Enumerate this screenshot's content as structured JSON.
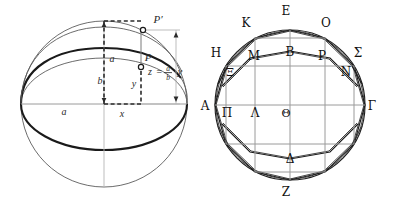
{
  "sheet": {
    "title": "Sphere with inscribed ellipse and Archimedean inscribed polygon",
    "background_color": "#ffffff",
    "ink_color": "#1a1a1a",
    "faint_ink_color": "#5b5b5b",
    "axis_color": "#9a9a9a",
    "width": 396,
    "height": 211
  },
  "figures": [
    {
      "id": "left-figure",
      "name": "sphere-ellipse-projection",
      "caption": "",
      "geometry": {
        "circle_center_x": 104,
        "circle_center_y": 104,
        "circle_radius": 83,
        "ellipse_semi_major": 83,
        "ellipse_semi_minor": 46
      },
      "labels": [
        {
          "key": "p_prime",
          "text": "P′",
          "x": 158,
          "y": 23,
          "style": "math"
        },
        {
          "key": "p",
          "text": "P",
          "x": 148,
          "y": 61,
          "style": "math"
        },
        {
          "key": "a_vert",
          "text": "a",
          "x": 112,
          "y": 62,
          "style": "math"
        },
        {
          "key": "b_vert",
          "text": "b",
          "x": 100,
          "y": 84,
          "style": "math"
        },
        {
          "key": "y_inner",
          "text": "y",
          "x": 134,
          "y": 87,
          "style": "math"
        },
        {
          "key": "a_horiz",
          "text": "a",
          "x": 64,
          "y": 115,
          "style": "math"
        },
        {
          "key": "x_horiz",
          "text": "x",
          "x": 122,
          "y": 117,
          "style": "math"
        }
      ],
      "equation": {
        "key": "z_relation",
        "lhs": "z",
        "equals": "=",
        "numerator": "a",
        "denominator": "b",
        "rhs": "y",
        "plain": "z = (a/b) y",
        "x": 152,
        "y": 72
      },
      "points": [
        {
          "key": "P",
          "x": 141,
          "y": 67
        },
        {
          "key": "P'",
          "x": 143,
          "y": 30
        }
      ]
    },
    {
      "id": "right-figure",
      "name": "circle-inscribed-polygon",
      "caption": "",
      "geometry": {
        "circle_center_x": 92,
        "circle_center_y": 105,
        "circle_radius": 75
      },
      "labels": [
        {
          "key": "E",
          "text": "Ε",
          "x": 88,
          "y": 15,
          "style": "greek"
        },
        {
          "key": "K",
          "text": "Κ",
          "x": 48,
          "y": 27,
          "style": "greek"
        },
        {
          "key": "O",
          "text": "Ο",
          "x": 128,
          "y": 27,
          "style": "greek"
        },
        {
          "key": "H",
          "text": "Η",
          "x": 18,
          "y": 57,
          "style": "greek"
        },
        {
          "key": "M",
          "text": "Μ",
          "x": 56,
          "y": 60,
          "style": "greek"
        },
        {
          "key": "B",
          "text": "Β",
          "x": 92,
          "y": 56,
          "style": "greek"
        },
        {
          "key": "P",
          "text": "Ρ",
          "x": 124,
          "y": 60,
          "style": "greek"
        },
        {
          "key": "Sigma",
          "text": "Σ",
          "x": 160,
          "y": 57,
          "style": "greek"
        },
        {
          "key": "Xi",
          "text": "Ξ",
          "x": 32,
          "y": 76,
          "style": "greek"
        },
        {
          "key": "N",
          "text": "Ν",
          "x": 148,
          "y": 76,
          "style": "greek"
        },
        {
          "key": "A",
          "text": "Α",
          "x": 7,
          "y": 110,
          "style": "greek"
        },
        {
          "key": "Pi",
          "text": "Π",
          "x": 29,
          "y": 117,
          "style": "greek"
        },
        {
          "key": "Lambda",
          "text": "Λ",
          "x": 57,
          "y": 117,
          "style": "greek"
        },
        {
          "key": "Theta",
          "text": "Θ",
          "x": 88,
          "y": 117,
          "style": "greek"
        },
        {
          "key": "Gamma",
          "text": "Γ",
          "x": 172,
          "y": 110,
          "style": "greek"
        },
        {
          "key": "Delta",
          "text": "Δ",
          "x": 92,
          "y": 163,
          "style": "greek"
        },
        {
          "key": "Z",
          "text": "Ζ",
          "x": 88,
          "y": 196,
          "style": "greek"
        }
      ],
      "vertices": [
        {
          "key": "A",
          "x": 17,
          "y": 105
        },
        {
          "key": "H",
          "x": 28,
          "y": 66
        },
        {
          "key": "K",
          "x": 57,
          "y": 38
        },
        {
          "key": "E",
          "x": 92,
          "y": 30
        },
        {
          "key": "O",
          "x": 127,
          "y": 38
        },
        {
          "key": "Sigma",
          "x": 156,
          "y": 66
        },
        {
          "key": "Gamma",
          "x": 167,
          "y": 105
        },
        {
          "key": "Z",
          "x": 92,
          "y": 180
        }
      ]
    }
  ]
}
